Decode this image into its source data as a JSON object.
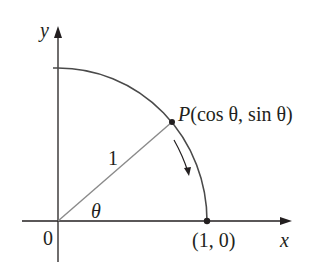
{
  "diagram": {
    "axes": {
      "x_label": "x",
      "y_label": "y",
      "origin_label": "0"
    },
    "radius_label": "1",
    "angle_label": "θ",
    "point_p": {
      "name": "P",
      "coords": "(cos θ, sin θ)"
    },
    "point_x_intercept": "(1, 0)",
    "colors": {
      "axis": "#231f20",
      "arc": "#4a4a4a",
      "radius": "#8a8a8a",
      "point": "#231f20"
    }
  }
}
